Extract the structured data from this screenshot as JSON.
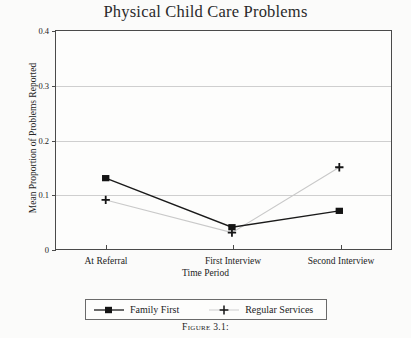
{
  "chart_data": {
    "type": "line",
    "title": "Physical Child Care Problems",
    "xlabel": "Time Period",
    "ylabel": "Mean Proportion of Problems Reported",
    "categories": [
      "At Referral",
      "First Interview",
      "Second Interview"
    ],
    "series": [
      {
        "name": "Family First",
        "values": [
          0.13,
          0.04,
          0.07
        ],
        "marker": "filled-square",
        "line": "solid-dark",
        "color": "#1a1a1a"
      },
      {
        "name": "Regular Services",
        "values": [
          0.09,
          0.03,
          0.15
        ],
        "marker": "plus",
        "line": "solid-light",
        "color": "#bdbdbd"
      }
    ],
    "ylim": [
      0,
      0.4
    ],
    "ytick_labels": [
      "0",
      "0.1",
      "0.2",
      "0.3",
      "0.4"
    ],
    "ytick_values": [
      0,
      0.1,
      0.2,
      0.3,
      0.4
    ],
    "grid": true,
    "grid_axis": "y",
    "legend_position": "bottom-outside"
  },
  "caption": "Figure 3.1:"
}
